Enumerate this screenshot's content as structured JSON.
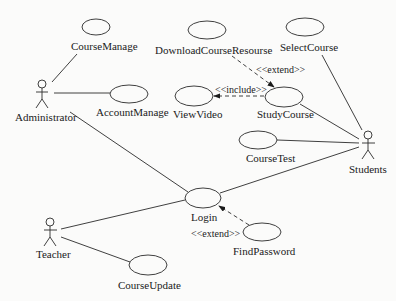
{
  "diagram": {
    "type": "UML use case diagram",
    "actors": [
      {
        "id": "administrator",
        "label": "Administrator"
      },
      {
        "id": "teacher",
        "label": "Teacher"
      },
      {
        "id": "students",
        "label": "Students"
      }
    ],
    "use_cases": [
      {
        "id": "course_manage",
        "label": "CourseManage"
      },
      {
        "id": "account_manage",
        "label": "AccountManage"
      },
      {
        "id": "download_course_resource",
        "label": "DownloadCourseResourse"
      },
      {
        "id": "view_video",
        "label": "ViewVideo"
      },
      {
        "id": "study_course",
        "label": "StudyCourse"
      },
      {
        "id": "select_course",
        "label": "SelectCourse"
      },
      {
        "id": "course_test",
        "label": "CourseTest"
      },
      {
        "id": "login",
        "label": "Login"
      },
      {
        "id": "find_password",
        "label": "FindPassword"
      },
      {
        "id": "course_update",
        "label": "CourseUpdate"
      }
    ],
    "stereotypes": {
      "extend_download": "<<extend>>",
      "include_view": "<<include>>",
      "extend_find": "<<extend>>"
    },
    "relations": [
      {
        "from": "administrator",
        "to": "course_manage",
        "type": "association"
      },
      {
        "from": "administrator",
        "to": "account_manage",
        "type": "association"
      },
      {
        "from": "administrator",
        "to": "login",
        "type": "association"
      },
      {
        "from": "teacher",
        "to": "login",
        "type": "association"
      },
      {
        "from": "teacher",
        "to": "course_update",
        "type": "association"
      },
      {
        "from": "students",
        "to": "select_course",
        "type": "association"
      },
      {
        "from": "students",
        "to": "study_course",
        "type": "association"
      },
      {
        "from": "students",
        "to": "course_test",
        "type": "association"
      },
      {
        "from": "students",
        "to": "login",
        "type": "association"
      },
      {
        "from": "download_course_resource",
        "to": "study_course",
        "type": "extend"
      },
      {
        "from": "study_course",
        "to": "view_video",
        "type": "include"
      },
      {
        "from": "find_password",
        "to": "login",
        "type": "extend"
      }
    ]
  }
}
